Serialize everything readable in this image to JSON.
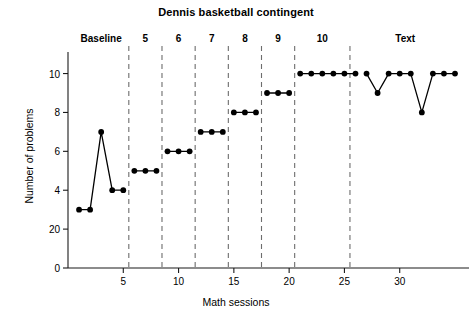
{
  "chart_data": {
    "type": "line",
    "title": "Dennis basketball contingent",
    "xlabel": "Math sessions",
    "ylabel": "Number of problems",
    "xlim": [
      0,
      35
    ],
    "ylim": [
      0,
      10.8
    ],
    "grid": false,
    "legend": "none",
    "marker": "filled-circle",
    "line_color": "#000000",
    "xticks": [
      5,
      10,
      15,
      20,
      25,
      30
    ],
    "xtick_labels": [
      "5",
      "10",
      "15",
      "20",
      "25",
      "30"
    ],
    "yticks": [
      0,
      2,
      4,
      6,
      8,
      10
    ],
    "ytick_labels": [
      "0",
      "20",
      "4",
      "6",
      "8",
      "10"
    ],
    "phase_dividers": [
      5.5,
      8.5,
      11.5,
      14.5,
      17.5,
      20.5,
      25.5
    ],
    "phases": [
      {
        "label": "Baseline",
        "label_x": 3.0,
        "x": [
          1,
          2,
          3,
          4,
          5
        ],
        "y": [
          3,
          3,
          7,
          4,
          4
        ]
      },
      {
        "label": "5",
        "label_x": 7.0,
        "x": [
          6,
          7,
          8
        ],
        "y": [
          5,
          5,
          5
        ]
      },
      {
        "label": "6",
        "label_x": 10.0,
        "x": [
          9,
          10,
          11
        ],
        "y": [
          6,
          6,
          6
        ]
      },
      {
        "label": "7",
        "label_x": 13.0,
        "x": [
          12,
          13,
          14
        ],
        "y": [
          7,
          7,
          7
        ]
      },
      {
        "label": "8",
        "label_x": 16.0,
        "x": [
          15,
          16,
          17
        ],
        "y": [
          8,
          8,
          8
        ]
      },
      {
        "label": "9",
        "label_x": 19.0,
        "x": [
          18,
          19,
          20
        ],
        "y": [
          9,
          9,
          9
        ]
      },
      {
        "label": "10",
        "label_x": 23.0,
        "x": [
          21,
          22,
          23,
          24,
          25,
          26
        ],
        "y": [
          10,
          10,
          10,
          10,
          10,
          10
        ]
      },
      {
        "label": "Text",
        "label_x": 30.5,
        "x": [
          27,
          28,
          29,
          30,
          31,
          32,
          33,
          34,
          35
        ],
        "y": [
          10,
          9,
          10,
          10,
          10,
          8,
          10,
          10,
          10
        ]
      }
    ]
  }
}
